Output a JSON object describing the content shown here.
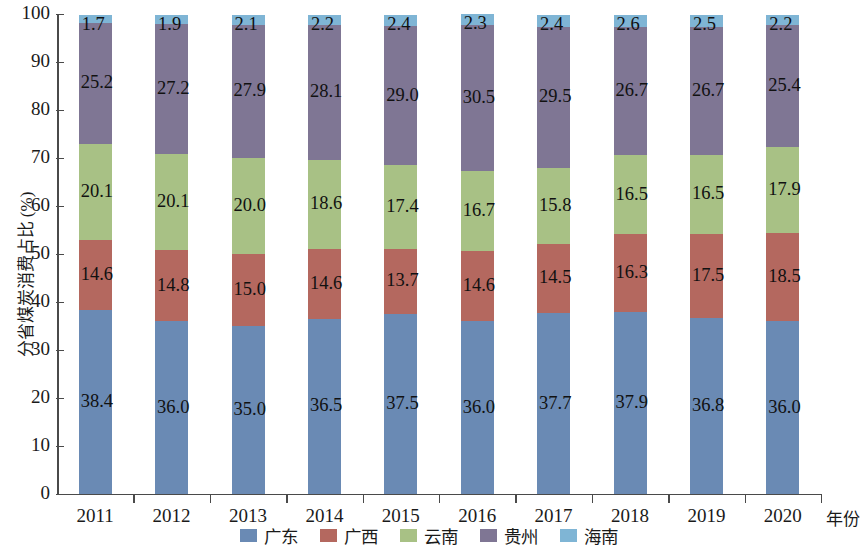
{
  "chart_data": {
    "type": "bar",
    "subtype": "stacked-percentage-column",
    "title": "",
    "xlabel": "年份",
    "ylabel": "分省煤炭消费占比 (%)",
    "ylim": [
      0,
      100
    ],
    "ytick_step": 10,
    "ytick_labels": [
      "0",
      "10",
      "20",
      "30",
      "40",
      "50",
      "60",
      "70",
      "80",
      "90",
      "100"
    ],
    "grid": false,
    "legend_position": "bottom-center",
    "categories": [
      "2011",
      "2012",
      "2013",
      "2014",
      "2015",
      "2016",
      "2017",
      "2018",
      "2019",
      "2020"
    ],
    "series": [
      {
        "name": "广东",
        "color": "#6a8ab4",
        "values": [
          38.4,
          36.0,
          35.0,
          36.5,
          37.5,
          36.0,
          37.7,
          37.9,
          36.8,
          36.0
        ]
      },
      {
        "name": "广西",
        "color": "#b4685f",
        "values": [
          14.6,
          14.8,
          15.0,
          14.6,
          13.7,
          14.6,
          14.5,
          16.3,
          17.5,
          18.5
        ]
      },
      {
        "name": "云南",
        "color": "#a8c185",
        "values": [
          20.1,
          20.1,
          20.0,
          18.6,
          17.4,
          16.7,
          15.8,
          16.5,
          16.5,
          17.9
        ]
      },
      {
        "name": "贵州",
        "color": "#7f7694",
        "values": [
          25.2,
          27.2,
          27.9,
          28.1,
          29.0,
          30.5,
          29.5,
          26.7,
          26.7,
          25.4
        ]
      },
      {
        "name": "海南",
        "color": "#7fb5d5",
        "values": [
          1.7,
          1.9,
          2.1,
          2.2,
          2.4,
          2.3,
          2.4,
          2.6,
          2.5,
          2.2
        ]
      }
    ]
  },
  "axis": {
    "x_title": "年份",
    "y_title": "分省煤炭消费占比 (%)"
  },
  "colors": {
    "axis": "#4a4a4a",
    "text": "#1a1a1a",
    "background": "#ffffff"
  }
}
